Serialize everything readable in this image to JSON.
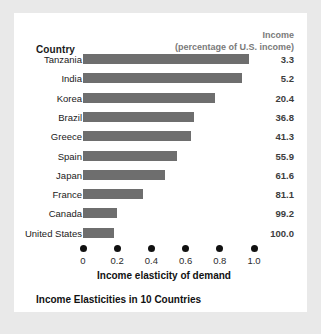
{
  "figure": {
    "column_header_country": "Country",
    "income_header_line1": "Income",
    "income_header_line2": "(percentage of U.S. income)",
    "caption": "Income Elasticities in 10 Countries",
    "bar_color": "#6e6e6e",
    "panel_color": "#ffffff",
    "background_color": "#e9e9e9"
  },
  "chart_data": {
    "type": "bar",
    "orientation": "horizontal",
    "title": "Income Elasticities in 10 Countries",
    "xlabel": "Income elasticity of demand",
    "ylabel": "Country",
    "xlim": [
      0,
      1.0
    ],
    "xticks": [
      0,
      0.2,
      0.4,
      0.6,
      0.8,
      1.0
    ],
    "xticklabels": [
      "0",
      "0.2",
      "0.4",
      "0.6",
      "0.8",
      "1.0"
    ],
    "grid": false,
    "legend": false,
    "categories": [
      "Tanzania",
      "India",
      "Korea",
      "Brazil",
      "Greece",
      "Spain",
      "Japan",
      "France",
      "Canada",
      "United States"
    ],
    "values": [
      0.97,
      0.93,
      0.77,
      0.65,
      0.63,
      0.55,
      0.48,
      0.35,
      0.2,
      0.18
    ],
    "annotation_column": {
      "label": "Income (percentage of U.S. income)",
      "values": [
        "3.3",
        "5.2",
        "20.4",
        "36.8",
        "41.3",
        "55.9",
        "61.6",
        "81.1",
        "99.2",
        "100.0"
      ]
    },
    "rows": [
      {
        "country": "Tanzania",
        "elasticity": 0.97,
        "income_pct": "3.3"
      },
      {
        "country": "India",
        "elasticity": 0.93,
        "income_pct": "5.2"
      },
      {
        "country": "Korea",
        "elasticity": 0.77,
        "income_pct": "20.4"
      },
      {
        "country": "Brazil",
        "elasticity": 0.65,
        "income_pct": "36.8"
      },
      {
        "country": "Greece",
        "elasticity": 0.63,
        "income_pct": "41.3"
      },
      {
        "country": "Spain",
        "elasticity": 0.55,
        "income_pct": "55.9"
      },
      {
        "country": "Japan",
        "elasticity": 0.48,
        "income_pct": "61.6"
      },
      {
        "country": "France",
        "elasticity": 0.35,
        "income_pct": "81.1"
      },
      {
        "country": "Canada",
        "elasticity": 0.2,
        "income_pct": "99.2"
      },
      {
        "country": "United States",
        "elasticity": 0.18,
        "income_pct": "100.0"
      }
    ]
  }
}
